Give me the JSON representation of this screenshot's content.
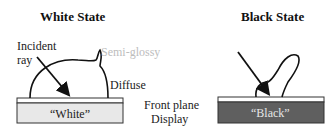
{
  "white_state": {
    "title": "White State",
    "incident_label_line1": "Incident",
    "incident_label_line2": "ray",
    "semi_glossy_label": "Semi-glossy",
    "diffuse_label": "Diffuse",
    "panel_label": "“White”",
    "panel_color": "#e8e8e8"
  },
  "black_state": {
    "title": "Black State",
    "panel_label": "“Black”",
    "panel_color": "#5f5f5f"
  },
  "front_plane": {
    "line1": "Front plane",
    "line2": "Display"
  }
}
